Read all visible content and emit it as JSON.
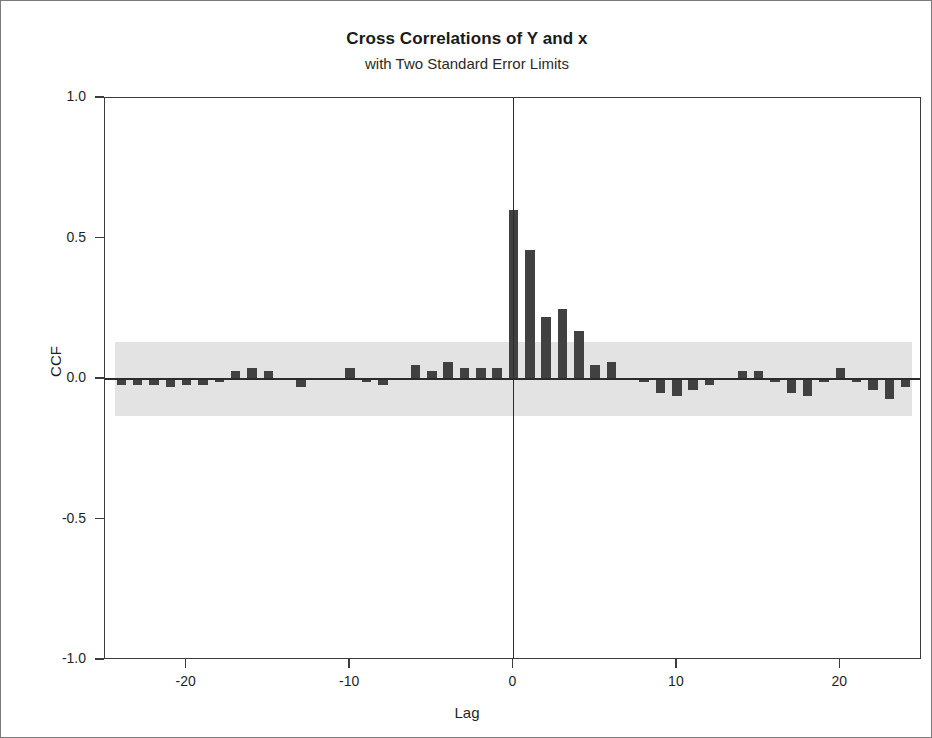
{
  "chart_data": {
    "type": "bar",
    "title": "Cross Correlations of Y and x",
    "subtitle": "with Two Standard Error Limits",
    "xlabel": "Lag",
    "ylabel": "CCF",
    "xlim": [
      -25,
      25
    ],
    "ylim": [
      -1.0,
      1.0
    ],
    "grid": false,
    "legend": null,
    "yticks": [
      "1.0",
      "0.5",
      "0.0",
      "-0.5",
      "-1.0"
    ],
    "ytick_values": [
      1.0,
      0.5,
      0.0,
      -0.5,
      -1.0
    ],
    "xticks": [
      "-20",
      "-10",
      "0",
      "10",
      "20"
    ],
    "xtick_values": [
      -20,
      -10,
      0,
      10,
      20
    ],
    "significance_band": {
      "upper": 0.13,
      "lower": -0.13,
      "color": "#e3e3e3",
      "label": "Two Standard Error Limits"
    },
    "bar_color": "#414141",
    "axis_color": "#2b2b2b",
    "x": [
      -24,
      -23,
      -22,
      -21,
      -20,
      -19,
      -18,
      -17,
      -16,
      -15,
      -14,
      -13,
      -12,
      -11,
      -10,
      -9,
      -8,
      -7,
      -6,
      -5,
      -4,
      -3,
      -2,
      -1,
      0,
      1,
      2,
      3,
      4,
      5,
      6,
      7,
      8,
      9,
      10,
      11,
      12,
      13,
      14,
      15,
      16,
      17,
      18,
      19,
      20,
      21,
      22,
      23,
      24
    ],
    "values": [
      -0.02,
      -0.02,
      -0.02,
      -0.03,
      -0.02,
      -0.02,
      -0.01,
      0.03,
      0.04,
      0.03,
      0.0,
      -0.03,
      0.0,
      0.0,
      0.04,
      -0.01,
      -0.02,
      0.0,
      0.05,
      0.03,
      0.06,
      0.04,
      0.04,
      0.04,
      0.6,
      0.46,
      0.22,
      0.25,
      0.17,
      0.05,
      0.06,
      0.0,
      -0.01,
      -0.05,
      -0.06,
      -0.04,
      -0.02,
      0.0,
      0.03,
      0.03,
      -0.01,
      -0.05,
      -0.06,
      -0.01,
      0.04,
      -0.01,
      -0.04,
      -0.07,
      -0.03
    ]
  }
}
